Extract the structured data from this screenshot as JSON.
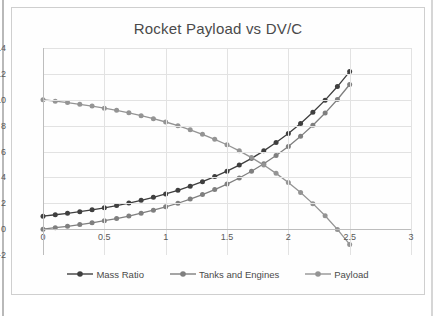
{
  "chart_data": {
    "type": "line",
    "title": "Rocket Payload vs DV/C",
    "xlabel": "",
    "ylabel": "",
    "xlim": [
      0,
      3
    ],
    "ylim": [
      -2,
      14
    ],
    "grid": true,
    "legend_position": "bottom",
    "x_ticks": [
      "0",
      "0.5",
      "1",
      "1.5",
      "2",
      "2.5",
      "3"
    ],
    "x_tick_values": [
      0,
      0.5,
      1,
      1.5,
      2,
      2.5,
      3
    ],
    "y_ticks": [
      "14",
      "12",
      "10",
      "8",
      "6",
      "4",
      "2",
      "0",
      "-2"
    ],
    "y_tick_values": [
      14,
      12,
      10,
      8,
      6,
      4,
      2,
      0,
      -2
    ],
    "x": [
      0,
      0.1,
      0.2,
      0.3,
      0.4,
      0.5,
      0.6,
      0.7,
      0.8,
      0.9,
      1.0,
      1.1,
      1.2,
      1.3,
      1.4,
      1.5,
      1.6,
      1.7,
      1.8,
      1.9,
      2.0,
      2.1,
      2.2,
      2.3,
      2.4,
      2.5
    ],
    "series": [
      {
        "name": "Mass Ratio",
        "color": "#3f3f3f",
        "marker": "circle",
        "values": [
          1.0,
          1.11,
          1.22,
          1.35,
          1.49,
          1.65,
          1.82,
          2.01,
          2.23,
          2.46,
          2.72,
          3.0,
          3.32,
          3.67,
          4.06,
          4.48,
          4.95,
          5.47,
          6.05,
          6.69,
          7.39,
          8.17,
          9.03,
          9.97,
          11.02,
          12.18
        ]
      },
      {
        "name": "Tanks and Engines",
        "color": "#7f7f7f",
        "marker": "circle",
        "values": [
          0.0,
          0.11,
          0.22,
          0.35,
          0.49,
          0.65,
          0.82,
          1.01,
          1.23,
          1.46,
          1.72,
          2.0,
          2.32,
          2.67,
          3.06,
          3.48,
          3.95,
          4.47,
          5.05,
          5.69,
          6.39,
          7.17,
          8.03,
          8.97,
          10.02,
          11.18
        ]
      },
      {
        "name": "Payload",
        "color": "#949494",
        "marker": "circle",
        "values": [
          10.0,
          9.89,
          9.78,
          9.65,
          9.51,
          9.35,
          9.18,
          8.99,
          8.77,
          8.54,
          8.28,
          8.0,
          7.68,
          7.33,
          6.94,
          6.52,
          6.05,
          5.53,
          4.95,
          4.31,
          3.61,
          2.83,
          1.97,
          1.03,
          -0.02,
          -1.18
        ]
      }
    ]
  },
  "figure": {
    "caption": ""
  }
}
